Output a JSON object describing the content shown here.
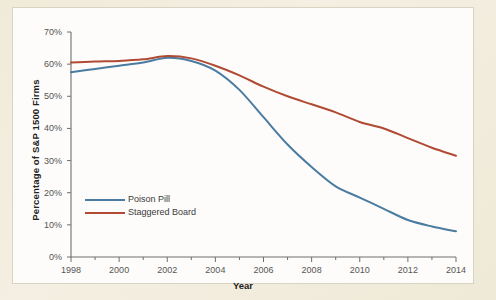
{
  "chart_data": {
    "type": "line",
    "title": "",
    "subtitle": "",
    "xlabel": "Year",
    "ylabel": "Percentage of S&P 1500 Firms",
    "xlim": [
      1998,
      2014
    ],
    "ylim": [
      0,
      70
    ],
    "grid": false,
    "legend_position": "inside-left",
    "x": [
      1998,
      1999,
      2000,
      2001,
      2002,
      2003,
      2004,
      2005,
      2006,
      2007,
      2008,
      2009,
      2010,
      2011,
      2012,
      2013,
      2014
    ],
    "xticks": [
      1998,
      2000,
      2002,
      2004,
      2006,
      2008,
      2010,
      2012,
      2014
    ],
    "xtick_labels": [
      "1998",
      "2000",
      "2002",
      "2004",
      "2006",
      "2008",
      "2010",
      "2012",
      "2014"
    ],
    "yticks": [
      0,
      10,
      20,
      30,
      40,
      50,
      60,
      70
    ],
    "ytick_labels": [
      "0%",
      "10%",
      "20%",
      "30%",
      "40%",
      "50%",
      "60%",
      "70%"
    ],
    "series": [
      {
        "name": "Poison Pill",
        "color": "#4a7ba0",
        "values": [
          57.5,
          58.5,
          59.5,
          60.5,
          62.0,
          61.0,
          58.0,
          52.0,
          43.5,
          35.0,
          28.0,
          22.0,
          18.5,
          15.0,
          11.5,
          9.5,
          8.0
        ]
      },
      {
        "name": "Staggered Board",
        "color": "#b04a33",
        "values": [
          60.5,
          60.8,
          61.0,
          61.5,
          62.5,
          61.8,
          59.5,
          56.5,
          53.0,
          50.0,
          47.5,
          45.0,
          42.0,
          40.0,
          37.0,
          34.0,
          31.5
        ]
      }
    ]
  },
  "legend": {
    "items": [
      {
        "label": "Poison Pill",
        "color": "#4a7ba0"
      },
      {
        "label": "Staggered Board",
        "color": "#b04a33"
      }
    ]
  },
  "axes": {
    "x_title": "Year",
    "y_title": "Percentage of S&P 1500 Firms"
  }
}
